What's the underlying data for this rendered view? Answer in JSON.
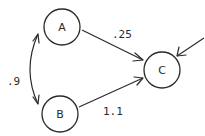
{
  "diagram": {
    "type": "directed-graph",
    "nodes": [
      {
        "id": "A",
        "label": "A",
        "cx": 62,
        "cy": 27,
        "r": 18
      },
      {
        "id": "B",
        "label": "B",
        "cx": 60,
        "cy": 114,
        "r": 18
      },
      {
        "id": "C",
        "label": "C",
        "cx": 162,
        "cy": 70,
        "r": 18
      }
    ],
    "edges": [
      {
        "from": "A",
        "to": "C",
        "label": ".25",
        "directed": true
      },
      {
        "from": "B",
        "to": "C",
        "label": "1.1",
        "directed": true
      },
      {
        "from": "A",
        "to": "B",
        "label": ".9",
        "directed": true,
        "bidirectional": true,
        "curved": true
      },
      {
        "from": "external",
        "to": "C",
        "label": "",
        "directed": true
      }
    ],
    "labels": {
      "node_a": "A",
      "node_b": "B",
      "node_c": "C",
      "edge_ac": ".25",
      "edge_bc": "1.1",
      "edge_ab": ".9"
    },
    "colors": {
      "stroke": "#2a2a2a",
      "background": "#ffffff"
    }
  }
}
